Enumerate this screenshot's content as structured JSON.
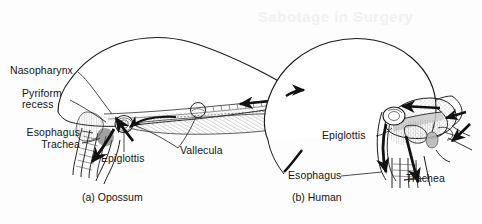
{
  "figure": {
    "background_color": "#fdfdfd",
    "ink_color": "#141414",
    "shading_color": "#b8b8b8"
  },
  "panels": [
    {
      "id": "opossum",
      "caption": "(a) Opossum",
      "labels": [
        {
          "name": "nasopharynx",
          "text": "Nasopharynx"
        },
        {
          "name": "pyriform-recess-line1",
          "text": "Pyriform"
        },
        {
          "name": "pyriform-recess-line2",
          "text": "recess"
        },
        {
          "name": "esophagus",
          "text": "Esophagus"
        },
        {
          "name": "trachea",
          "text": "Trachea"
        },
        {
          "name": "epiglottis",
          "text": "Epiglottis"
        },
        {
          "name": "vallecula",
          "text": "Vallecula"
        }
      ]
    },
    {
      "id": "human",
      "caption": "(b) Human",
      "labels": [
        {
          "name": "epiglottis",
          "text": "Epiglottis"
        },
        {
          "name": "esophagus",
          "text": "Esophagus"
        },
        {
          "name": "trachea",
          "text": "Trachea"
        }
      ]
    }
  ],
  "ghost_text": {
    "note": "Sabotage in Surgery"
  }
}
